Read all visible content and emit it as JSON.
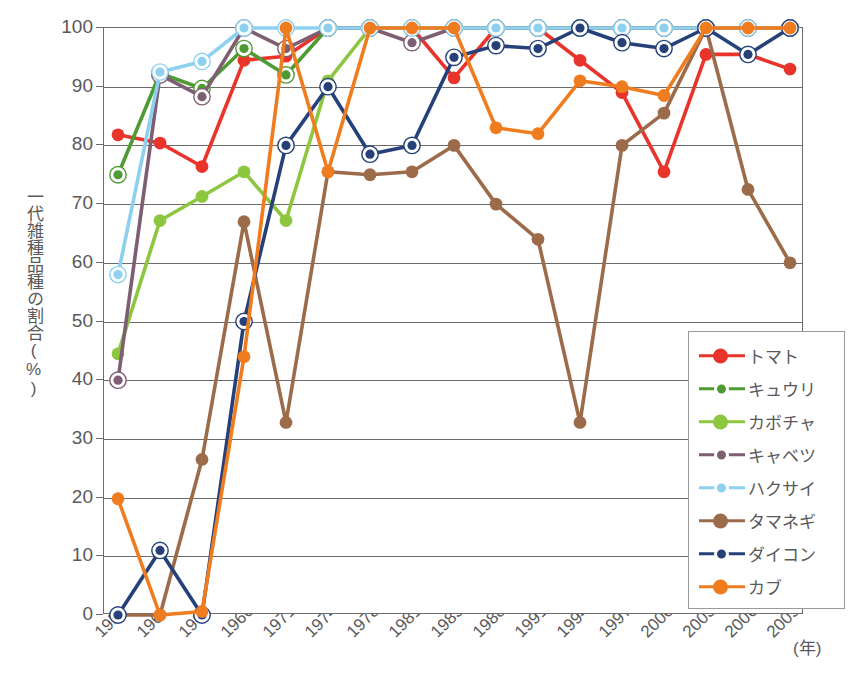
{
  "chart_data": {
    "type": "line",
    "title": "",
    "xlabel": "(年)",
    "ylabel": "一代雑種品種の割合(%)",
    "ylim": [
      0,
      100
    ],
    "ytick_step": 10,
    "grid": true,
    "legend_position": "bottom-right",
    "categories": [
      "1958",
      "1960",
      "1963",
      "1966",
      "1971",
      "1974",
      "1978",
      "1981",
      "1985",
      "1988",
      "1991",
      "1994",
      "1997",
      "2000",
      "2003",
      "2006",
      "2009"
    ],
    "yticks": [
      "0",
      "10",
      "20",
      "30",
      "40",
      "50",
      "60",
      "70",
      "80",
      "90",
      "100"
    ],
    "series": [
      {
        "name": "トマト",
        "color": "#e8342a",
        "marker": "solid",
        "values": [
          81.8,
          80.4,
          76.4,
          94.5,
          95.2,
          100,
          100,
          100,
          91.5,
          100,
          100,
          94.5,
          89.0,
          75.5,
          95.5,
          95.5,
          93.0
        ]
      },
      {
        "name": "キュウリ",
        "color": "#4e9b34",
        "marker": "ring",
        "values": [
          75.0,
          92.3,
          89.7,
          96.5,
          92.0,
          100,
          100,
          100,
          100,
          100,
          100,
          100,
          100,
          100,
          100,
          100,
          100
        ]
      },
      {
        "name": "カボチャ",
        "color": "#8dc63f",
        "marker": "solid",
        "values": [
          44.5,
          67.2,
          71.3,
          75.5,
          67.2,
          91.0,
          100,
          100,
          100,
          100,
          100,
          100,
          100,
          100,
          100,
          100,
          100
        ]
      },
      {
        "name": "キャベツ",
        "color": "#7d5e72",
        "marker": "ring",
        "values": [
          40.0,
          92.0,
          88.3,
          100,
          96.5,
          100,
          100,
          97.5,
          100,
          100,
          100,
          100,
          100,
          100,
          100,
          100,
          100
        ]
      },
      {
        "name": "ハクサイ",
        "color": "#8dd0ef",
        "marker": "ring",
        "values": [
          58.0,
          92.5,
          94.3,
          100,
          100,
          100,
          100,
          100,
          100,
          100,
          100,
          100,
          100,
          100,
          100,
          100,
          100
        ]
      },
      {
        "name": "タマネギ",
        "color": "#9c6b4a",
        "marker": "solid",
        "values": [
          0,
          0,
          26.5,
          67.0,
          32.8,
          75.5,
          75.0,
          75.5,
          80.0,
          70.0,
          64.0,
          32.8,
          80.0,
          85.5,
          100,
          72.5,
          60.0
        ]
      },
      {
        "name": "ダイコン",
        "color": "#26417a",
        "marker": "ring",
        "values": [
          0,
          11.0,
          0,
          50.0,
          80.0,
          90.0,
          78.5,
          80.0,
          95.0,
          97.0,
          96.5,
          100,
          97.5,
          96.5,
          100,
          95.5,
          100
        ]
      },
      {
        "name": "カブ",
        "color": "#f07c20",
        "marker": "solid",
        "values": [
          19.8,
          0,
          0.6,
          44.0,
          100,
          75.5,
          100,
          100,
          100,
          83.0,
          82.0,
          91.0,
          90.0,
          88.5,
          100,
          100,
          100
        ]
      }
    ]
  }
}
